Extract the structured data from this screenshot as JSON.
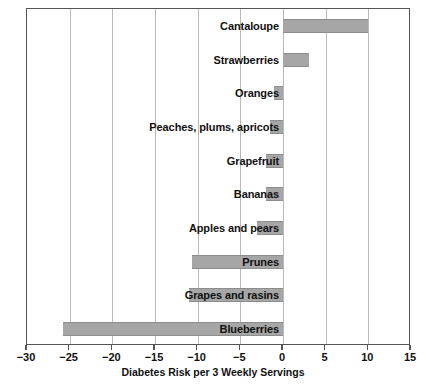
{
  "chart_data": {
    "type": "bar",
    "orientation": "horizontal",
    "title": "",
    "subtitle": "",
    "xlabel": "Diabetes Risk per 3 Weekly Servings",
    "ylabel": "",
    "xlim": [
      -30,
      15
    ],
    "ylim": null,
    "grid": true,
    "legend": null,
    "legend_position": "none",
    "xticks": [
      -30,
      -25,
      -20,
      -15,
      -10,
      -5,
      0,
      5,
      10,
      15
    ],
    "xticklabels": [
      "−30",
      "−25",
      "−20",
      "−15",
      "−10",
      "−5",
      "0",
      "5",
      "10",
      "15"
    ],
    "categories": [
      "Cantaloupe",
      "Strawberries",
      "Oranges",
      "Peaches, plums, apricots",
      "Grapefruit",
      "Bananas",
      "Apples and pears",
      "Prunes",
      "Grapes and rasins",
      "Blueberries"
    ],
    "values": [
      10,
      3,
      -1,
      -1.5,
      -2,
      -2,
      -3,
      -10.7,
      -11,
      -25.8
    ],
    "bar_color": "#a6a6a6",
    "bar_edge_color": "#8d8d8d",
    "gridline_color": "#b9b9b9",
    "axis_color": "#555555",
    "background_color": "#ffffff"
  }
}
